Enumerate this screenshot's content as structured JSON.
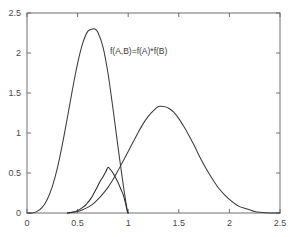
{
  "chart_data": {
    "type": "line",
    "title": "",
    "xlabel": "",
    "ylabel": "",
    "xlim": [
      0,
      2.5
    ],
    "ylim": [
      0,
      2.5
    ],
    "grid": false,
    "legend_position": "none",
    "xticks": [
      "0",
      "0.5",
      "1",
      "1.5",
      "2",
      "2.5"
    ],
    "xtick_values": [
      0,
      0.5,
      1,
      1.5,
      2,
      2.5
    ],
    "yticks": [
      "0",
      "0.5",
      "1",
      "1.5",
      "2",
      "2.5"
    ],
    "ytick_values": [
      0,
      0.5,
      1,
      1.5,
      2,
      2.5
    ],
    "annotations": [
      {
        "text": "f(A,B)=f(A)*f(B)",
        "x": 0.82,
        "y": 2.07
      }
    ],
    "series": [
      {
        "name": "f(A)",
        "color": "#3b3b3b",
        "peak_x": 0.67,
        "peak_y": 2.3,
        "x": [
          0.0,
          0.05,
          0.1,
          0.15,
          0.2,
          0.25,
          0.3,
          0.35,
          0.4,
          0.45,
          0.5,
          0.55,
          0.6,
          0.65,
          0.67,
          0.7,
          0.75,
          0.8,
          0.85,
          0.9,
          0.95,
          0.99,
          1.0
        ],
        "values": [
          0.0,
          0.0,
          0.02,
          0.07,
          0.17,
          0.33,
          0.56,
          0.86,
          1.2,
          1.55,
          1.87,
          2.12,
          2.27,
          2.3,
          2.3,
          2.26,
          2.08,
          1.75,
          1.3,
          0.82,
          0.36,
          0.04,
          0.0
        ]
      },
      {
        "name": "f(B)",
        "color": "#3b3b3b",
        "peak_x": 1.3,
        "peak_y": 1.33,
        "x": [
          0.4,
          0.45,
          0.5,
          0.55,
          0.6,
          0.65,
          0.7,
          0.75,
          0.8,
          0.85,
          0.9,
          0.95,
          1.0,
          1.05,
          1.1,
          1.15,
          1.2,
          1.25,
          1.3,
          1.35,
          1.4,
          1.45,
          1.5,
          1.55,
          1.6,
          1.65,
          1.7,
          1.75,
          1.8,
          1.85,
          1.9,
          1.95,
          2.0,
          2.05,
          2.1,
          2.15,
          2.2,
          2.25,
          2.3,
          2.4,
          2.5
        ],
        "values": [
          0.0,
          0.01,
          0.02,
          0.04,
          0.07,
          0.11,
          0.17,
          0.24,
          0.32,
          0.42,
          0.53,
          0.65,
          0.77,
          0.89,
          1.01,
          1.12,
          1.21,
          1.28,
          1.33,
          1.33,
          1.31,
          1.26,
          1.18,
          1.08,
          0.97,
          0.85,
          0.72,
          0.6,
          0.49,
          0.39,
          0.3,
          0.23,
          0.17,
          0.12,
          0.08,
          0.06,
          0.04,
          0.02,
          0.01,
          0.0,
          0.0
        ]
      },
      {
        "name": "f(A,B)=f(A)*f(B)",
        "color": "#2a2a2a",
        "peak_x": 0.8,
        "peak_y": 0.57,
        "truncated_at": 1.0,
        "x": [
          0.4,
          0.45,
          0.5,
          0.55,
          0.58,
          0.6,
          0.63,
          0.65,
          0.68,
          0.7,
          0.72,
          0.75,
          0.78,
          0.8,
          0.82,
          0.85,
          0.88,
          0.9,
          0.93,
          0.95,
          0.97,
          0.99,
          1.0
        ],
        "values": [
          0.0,
          0.01,
          0.03,
          0.07,
          0.1,
          0.13,
          0.18,
          0.22,
          0.29,
          0.34,
          0.39,
          0.45,
          0.52,
          0.57,
          0.55,
          0.5,
          0.43,
          0.38,
          0.29,
          0.23,
          0.14,
          0.03,
          0.0
        ]
      }
    ]
  },
  "axes": {
    "frame_color": "#6e6e6e",
    "tick_color": "#6e6e6e"
  }
}
